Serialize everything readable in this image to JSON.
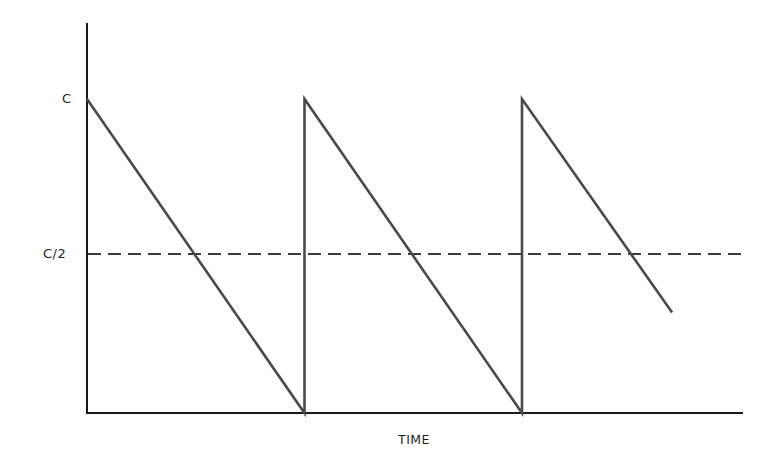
{
  "chart_data": {
    "type": "line",
    "title": "",
    "xlabel": "TIME",
    "ylabel": "",
    "y_tick_labels": [
      "C",
      "C/2"
    ],
    "y_ticks": [
      1.0,
      0.5
    ],
    "ylim": [
      0,
      1.2
    ],
    "grid": false,
    "legend": null,
    "series": [
      {
        "name": "sawtooth",
        "style": "solid",
        "points": [
          {
            "t": 0.0,
            "y": 1.0
          },
          {
            "t": 1.0,
            "y": 0.0
          },
          {
            "t": 1.0,
            "y": 1.0
          },
          {
            "t": 2.0,
            "y": 0.0
          },
          {
            "t": 2.0,
            "y": 1.0
          },
          {
            "t": 2.69,
            "y": 0.32
          }
        ]
      },
      {
        "name": "C/2 reference",
        "style": "dashed",
        "points": [
          {
            "t": 0.0,
            "y": 0.5
          },
          {
            "t": 3.0,
            "y": 0.5
          }
        ]
      }
    ],
    "xlim": [
      0,
      3.0
    ]
  },
  "labels": {
    "y_c": "C",
    "y_c_half": "C/2",
    "x_axis": "TIME"
  },
  "colors": {
    "axis": "#1a1a1a",
    "line": "#4a4a4a",
    "dash": "#3a3a3a"
  }
}
